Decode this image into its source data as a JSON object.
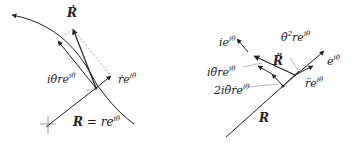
{
  "left_diagram": {
    "labels": {
      "R_dot": "Ṙ",
      "i_theta_dot": "iθ̇re",
      "i_theta_dot_sup": "iθ",
      "r_dot": "ṙe",
      "r_dot_sup": "iθ",
      "R_eq_main": "R",
      "R_eq_rest": " = re",
      "R_eq_sup": "iθ"
    }
  },
  "right_diagram": {
    "labels": {
      "ie": "ie",
      "ie_sup": "iθ",
      "theta_dot_sq": "θ̇",
      "theta_dot_sq_pow": "2",
      "theta_dot_sq_rest": "re",
      "theta_dot_sq_sup": "iθ",
      "R_ddot": "R̈",
      "e": "e",
      "e_sup": "iθ",
      "i_theta_ddot": "iθ̈re",
      "i_theta_ddot_sup": "iθ",
      "two_i": "2iθ̇ṙe",
      "two_i_sup": "iθ",
      "r_ddot": "r̈e",
      "r_ddot_sup": "iθ",
      "R": "R"
    }
  },
  "colors": {
    "ink": "#222222",
    "dashed": "#777777"
  }
}
